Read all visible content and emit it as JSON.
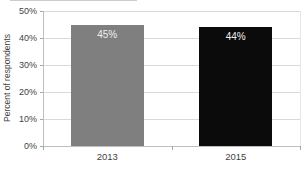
{
  "chart_data": {
    "type": "bar",
    "title": "",
    "categories": [
      "2013",
      "2015"
    ],
    "values": [
      45,
      44
    ],
    "value_labels": [
      "45%",
      "44%"
    ],
    "xlabel": "",
    "ylabel": "Percent of respondents",
    "ylim": [
      0,
      50
    ],
    "ytick_step": 10,
    "ytick_labels": [
      "0%",
      "10%",
      "20%",
      "30%",
      "40%",
      "50%"
    ],
    "grid": "horizontal",
    "legend_position": "none",
    "bar_colors": [
      "#7f7f7f",
      "#0b0b0b"
    ],
    "value_label_color": "#f0f0f0"
  },
  "style": {
    "background": "#ffffff",
    "gridline_color": "#d9d9d9",
    "axis_line_color": "#bfbfbf",
    "tick_mark_color": "#a6a6a6",
    "tick_label_color": "#3f3f3f",
    "plot_right_border_color": "#e6e6e6",
    "top_artifact_color": "#cccccc"
  }
}
